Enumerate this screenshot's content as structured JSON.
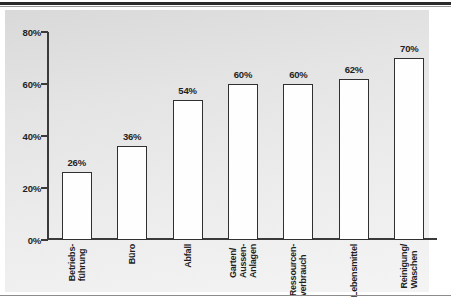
{
  "figure": {
    "background_color": "#ffffff",
    "panel_color": "#e6e6e6",
    "axis_color": "#3a3a3a",
    "bar_fill_color": "#fefefe",
    "bar_edge_color": "#303030",
    "text_color": "#1f1f1f"
  },
  "chart_data": {
    "type": "bar",
    "title": "",
    "subtitle": "",
    "xlabel": "",
    "ylabel": "",
    "ylim": [
      0,
      80
    ],
    "grid": false,
    "legend": null,
    "ytick_labels": [
      "0%",
      "20%",
      "40%",
      "60%",
      "80%"
    ],
    "ytick_values": [
      0,
      20,
      40,
      60,
      80
    ],
    "categories": [
      "Betriebs-führung",
      "Büro",
      "Abfall",
      "Garten/Aussen-Anlagen",
      "Ressourcen-verbrauch",
      "Lebensmittel",
      "Reinigung/Waschen"
    ],
    "category_lines": [
      [
        "Betriebs-",
        "führung"
      ],
      [
        "Büro"
      ],
      [
        "Abfall"
      ],
      [
        "Garten/",
        "Aussen-",
        "Anlagen"
      ],
      [
        "Ressourcen-",
        "verbrauch"
      ],
      [
        "Lebensmittel"
      ],
      [
        "Reinigung/",
        "Waschen"
      ]
    ],
    "values": [
      26,
      36,
      54,
      60,
      60,
      62,
      70
    ],
    "value_labels": [
      "26%",
      "36%",
      "54%",
      "60%",
      "60%",
      "62%",
      "70%"
    ]
  }
}
